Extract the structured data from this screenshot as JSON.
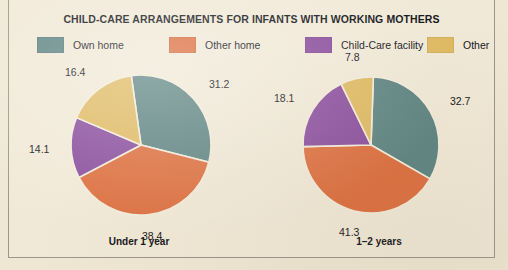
{
  "chart_data": {
    "type": "pie",
    "title": "CHILD-CARE ARRANGEMENTS FOR INFANTS WITH WORKING MOTHERS",
    "legend_position": "top",
    "categories": [
      "Own home",
      "Other home",
      "Child-Care facility",
      "Other"
    ],
    "colors": [
      "#5f8583",
      "#dd7040",
      "#8b4f9e",
      "#dfba63"
    ],
    "units": "percent",
    "charts": [
      {
        "caption": "Under 1 year",
        "values": [
          31.2,
          38.4,
          14.1,
          16.4
        ],
        "labels": [
          "31.2",
          "38.4",
          "14.1",
          "16.4"
        ]
      },
      {
        "caption": "1–2 years",
        "values": [
          32.7,
          41.3,
          18.1,
          7.8
        ],
        "labels": [
          "32.7",
          "41.3",
          "18.1",
          "7.8"
        ]
      }
    ]
  },
  "figure": {
    "background_color": "#efe7d4",
    "panel_color": "#f1e9d7",
    "border_color": "#9b958a",
    "text_color": "#16161a"
  }
}
